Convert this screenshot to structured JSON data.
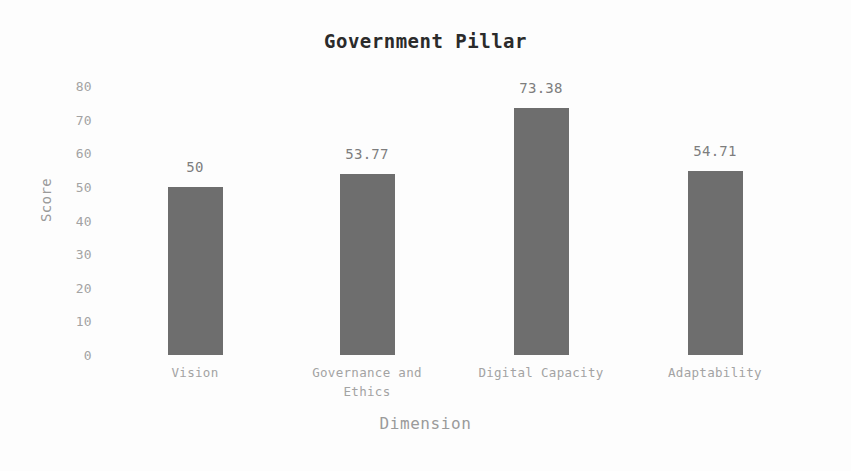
{
  "chart_data": {
    "type": "bar",
    "title": "Government Pillar",
    "xlabel": "Dimension",
    "ylabel": "Score",
    "categories": [
      "Vision",
      "Governance and Ethics",
      "Digital Capacity",
      "Adaptability"
    ],
    "values": [
      50,
      53.77,
      73.38,
      54.71
    ],
    "data_labels": [
      "50",
      "53.77",
      "73.38",
      "54.71"
    ],
    "ylim": [
      0,
      80
    ],
    "yticks": [
      80,
      70,
      60,
      50,
      40,
      30,
      20,
      10,
      0
    ],
    "ytick_labels": [
      "80",
      "70",
      "60",
      "50",
      "40",
      "30",
      "20",
      "10",
      "0"
    ],
    "xlim": [
      0,
      4
    ],
    "grid": false,
    "legend": null,
    "bar_color": "#6e6e6e",
    "background_color": "#fdfdfd",
    "title_color": "#2b2b2b",
    "axis_label_color": "#9a9a9a",
    "tick_label_color": "#a3a3a3",
    "data_label_color": "#7d7d7d"
  },
  "category_lines": [
    [
      "Vision"
    ],
    [
      "Governance and",
      "Ethics"
    ],
    [
      "Digital Capacity"
    ],
    [
      "Adaptability"
    ]
  ]
}
